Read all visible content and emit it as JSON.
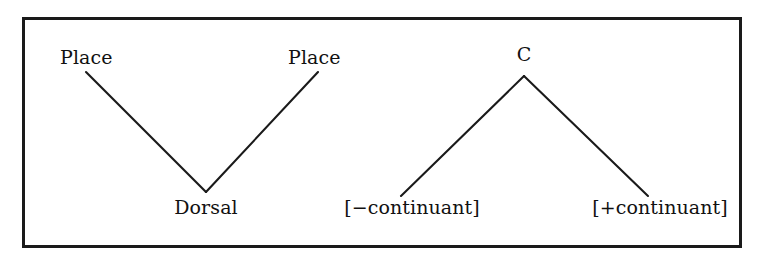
{
  "figure": {
    "background_color": "#ffffff",
    "border_color": "#1a1a1a",
    "line_color": "#1a1a1a",
    "text_color": "#111111",
    "trees": [
      {
        "id": "left-tree",
        "shape": "converging-v",
        "top_nodes": [
          {
            "id": "place-left",
            "label": "Place"
          },
          {
            "id": "place-right",
            "label": "Place"
          }
        ],
        "bottom_nodes": [
          {
            "id": "dorsal",
            "label": "Dorsal"
          }
        ],
        "edges": [
          {
            "from": "place-left",
            "to": "dorsal"
          },
          {
            "from": "place-right",
            "to": "dorsal"
          }
        ]
      },
      {
        "id": "right-tree",
        "shape": "branching-v",
        "top_nodes": [
          {
            "id": "c-node",
            "label": "C"
          }
        ],
        "bottom_nodes": [
          {
            "id": "minus-continuant",
            "label": "[−continuant]"
          },
          {
            "id": "plus-continuant",
            "label": "[+continuant]"
          }
        ],
        "edges": [
          {
            "from": "c-node",
            "to": "minus-continuant"
          },
          {
            "from": "c-node",
            "to": "plus-continuant"
          }
        ]
      }
    ]
  }
}
